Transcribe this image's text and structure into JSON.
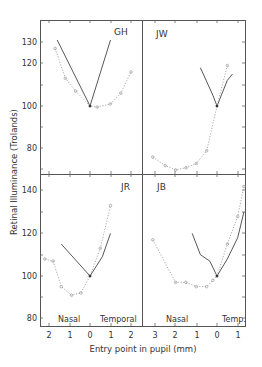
{
  "figure": {
    "ylabel": "Retinal Illuminance (Trolands)",
    "xlabel": "Entry point in pupil (mm)",
    "region_labels": {
      "left_nasal": "Nasal",
      "left_temporal": "Temporal",
      "right_nasal": "Nasal",
      "right_temporal": "Temp."
    },
    "top_yticks": [
      "130",
      "120",
      "100",
      "80"
    ],
    "bottom_yticks": [
      "140",
      "120",
      "100",
      "80"
    ],
    "left_xticks": [
      "2",
      "1",
      "0",
      "1",
      "2"
    ],
    "right_xticks": [
      "3",
      "2",
      "1",
      "0",
      "1"
    ]
  },
  "chart_data": [
    {
      "type": "line",
      "title": "GH",
      "xlabel": "Entry point in pupil (mm)",
      "ylabel": "Retinal Illuminance (Trolands)",
      "x_note": "negative = nasal, positive = temporal",
      "ylim": [
        67,
        140
      ],
      "xlim": [
        -2.4,
        2.5
      ],
      "series": [
        {
          "name": "solid",
          "style": "solid",
          "x": [
            -1.6,
            0,
            1.0
          ],
          "y": [
            131,
            100,
            131
          ]
        },
        {
          "name": "dotted",
          "style": "dotted",
          "x": [
            -1.7,
            -1.2,
            -0.7,
            0,
            0.35,
            1.0,
            1.5,
            2.0
          ],
          "y": [
            127,
            113,
            107,
            100,
            99.5,
            101,
            106,
            116
          ]
        }
      ]
    },
    {
      "type": "line",
      "title": "JW",
      "ylim": [
        67,
        140
      ],
      "series": [
        {
          "name": "solid",
          "style": "solid",
          "x": [
            -0.8,
            -0.2,
            0,
            0.5,
            0.75
          ],
          "y": [
            118,
            105,
            100,
            112,
            115
          ]
        },
        {
          "name": "dotted",
          "style": "dotted",
          "x": [
            -3.1,
            -2.5,
            -2.0,
            -1.5,
            -1.0,
            -0.5,
            0,
            0.5
          ],
          "y": [
            76,
            72,
            70,
            71,
            73,
            79,
            100,
            119
          ]
        }
      ]
    },
    {
      "type": "line",
      "title": "JR",
      "ylim": [
        77,
        148
      ],
      "series": [
        {
          "name": "solid",
          "style": "solid",
          "x": [
            -1.4,
            0,
            0.6,
            1.0
          ],
          "y": [
            115,
            100,
            109,
            120
          ]
        },
        {
          "name": "dotted",
          "style": "dotted",
          "x": [
            -2.2,
            -1.8,
            -1.4,
            -0.9,
            -0.45,
            0,
            0.5,
            1.0
          ],
          "y": [
            108,
            107,
            95,
            91,
            92,
            100,
            113,
            133
          ]
        }
      ]
    },
    {
      "type": "line",
      "title": "JB",
      "ylim": [
        77,
        148
      ],
      "series": [
        {
          "name": "solid",
          "style": "solid",
          "x": [
            -1.2,
            -0.8,
            -0.35,
            0,
            0.5,
            1.0,
            1.3
          ],
          "y": [
            120,
            110,
            107,
            100,
            108,
            118,
            130
          ]
        },
        {
          "name": "dotted",
          "style": "dotted",
          "x": [
            -3.1,
            -2.0,
            -1.5,
            -1.0,
            -0.5,
            -0.2,
            0,
            0.5,
            1.0,
            1.3
          ],
          "y": [
            117,
            97,
            97,
            95,
            95,
            98,
            100,
            115,
            128,
            142
          ]
        }
      ]
    }
  ]
}
